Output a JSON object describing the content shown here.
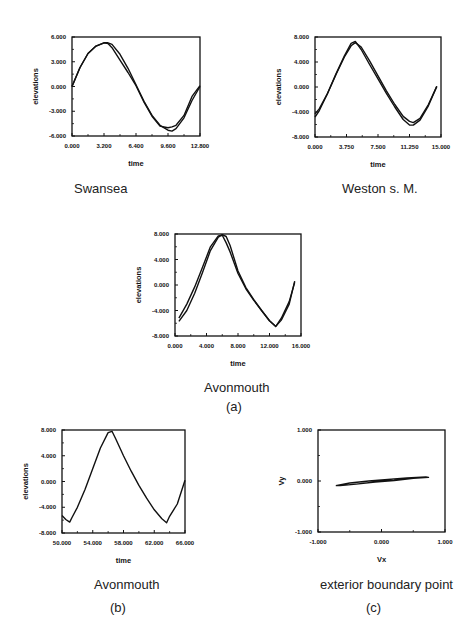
{
  "figure": {
    "part_labels": {
      "a": "(a)",
      "b": "(b)",
      "c": "(c)"
    }
  },
  "chart_data": [
    {
      "id": "swansea",
      "type": "line",
      "caption": "Swansea",
      "xlabel": "time",
      "ylabel": "elevations",
      "xlim": [
        0,
        12800
      ],
      "ylim": [
        -6000,
        6000
      ],
      "xticks": [
        "0.000",
        "3.200",
        "6.400",
        "9.600",
        "12.800"
      ],
      "yticks": [
        "6.000",
        "3.000",
        "0.000",
        "-3.000",
        "-6.000"
      ],
      "grid": false,
      "series": [
        {
          "name": "computed",
          "x": [
            0,
            800,
            1600,
            2400,
            3200,
            3600,
            4000,
            4800,
            5600,
            6400,
            7200,
            8000,
            8800,
            9600,
            10000,
            10400,
            11200,
            12000,
            12800
          ],
          "y": [
            0,
            2300,
            4000,
            4900,
            5300,
            5300,
            5100,
            3900,
            2200,
            200,
            -1800,
            -3500,
            -4700,
            -5300,
            -5400,
            -5100,
            -3800,
            -1700,
            0
          ]
        },
        {
          "name": "observed",
          "x": [
            0,
            800,
            1600,
            2400,
            3200,
            3600,
            4000,
            4800,
            5600,
            6400,
            7200,
            8000,
            8800,
            9600,
            10000,
            10400,
            11200,
            12000,
            12800
          ],
          "y": [
            0,
            2300,
            4000,
            4900,
            5300,
            5200,
            4700,
            3200,
            1700,
            100,
            -1900,
            -3600,
            -4800,
            -5000,
            -4900,
            -4700,
            -3500,
            -1200,
            100
          ]
        }
      ]
    },
    {
      "id": "weston",
      "type": "line",
      "caption": "Weston s. M.",
      "xlabel": "time",
      "ylabel": "elevations",
      "xlim": [
        0,
        15000
      ],
      "ylim": [
        -8000,
        8000
      ],
      "xticks": [
        "0.000",
        "3.750",
        "7.500",
        "11.250",
        "15.000"
      ],
      "yticks": [
        "8.000",
        "4.000",
        "0.000",
        "-4.000",
        "-8.000"
      ],
      "grid": false,
      "series": [
        {
          "name": "computed",
          "x": [
            0,
            500,
            1500,
            2500,
            3500,
            4300,
            4800,
            5500,
            6500,
            7500,
            8500,
            9500,
            10500,
            11250,
            11700,
            12500,
            13500,
            14500
          ],
          "y": [
            -4800,
            -3800,
            -1000,
            2000,
            4800,
            6600,
            7100,
            6400,
            4200,
            1800,
            -600,
            -2800,
            -4700,
            -5500,
            -5700,
            -5000,
            -2800,
            100
          ]
        },
        {
          "name": "observed",
          "x": [
            0,
            500,
            1500,
            2500,
            3500,
            4300,
            4800,
            5500,
            6500,
            7500,
            8500,
            9500,
            10500,
            11250,
            11700,
            12500,
            13500,
            14500
          ],
          "y": [
            -4300,
            -3500,
            -1000,
            2100,
            5000,
            7000,
            7300,
            6000,
            3600,
            1300,
            -1000,
            -3200,
            -5200,
            -6100,
            -6100,
            -5300,
            -3000,
            100
          ]
        }
      ]
    },
    {
      "id": "avonmouth_a",
      "type": "line",
      "caption": "Avonmouth",
      "xlabel": "time",
      "ylabel": "elevations",
      "xlim": [
        0,
        16000
      ],
      "ylim": [
        -8000,
        8000
      ],
      "xticks": [
        "0.000",
        "4.000",
        "8.000",
        "12.000",
        "16.000"
      ],
      "yticks": [
        "8.000",
        "4.000",
        "0.000",
        "-4.000",
        "-8.000"
      ],
      "grid": false,
      "series": [
        {
          "name": "computed",
          "x": [
            500,
            1500,
            2500,
            3500,
            4500,
            5500,
            6000,
            6500,
            7000,
            8000,
            9000,
            10000,
            11000,
            12000,
            12800,
            13500,
            14500,
            15200
          ],
          "y": [
            -5200,
            -3000,
            -300,
            2800,
            6000,
            7700,
            7800,
            6600,
            5200,
            1800,
            -600,
            -2400,
            -4000,
            -5600,
            -6500,
            -5200,
            -2600,
            400
          ]
        },
        {
          "name": "observed",
          "x": [
            500,
            1500,
            2500,
            3500,
            4500,
            5500,
            6000,
            6500,
            7000,
            8000,
            9000,
            10000,
            11000,
            12000,
            12800,
            13500,
            14500,
            15200
          ],
          "y": [
            -5700,
            -4000,
            -1300,
            2000,
            5400,
            7500,
            7900,
            7600,
            6200,
            2200,
            -400,
            -2300,
            -4000,
            -5600,
            -6500,
            -5500,
            -3000,
            600
          ]
        }
      ]
    },
    {
      "id": "avonmouth_b",
      "type": "line",
      "caption": "Avonmouth",
      "xlabel": "time",
      "ylabel": "elevations",
      "xlim": [
        50000,
        66000
      ],
      "ylim": [
        -8000,
        8000
      ],
      "xticks": [
        "50.000",
        "54.000",
        "58.000",
        "62.000",
        "66.000"
      ],
      "yticks": [
        "8.000",
        "4.000",
        "0.000",
        "-4.000",
        "-8.000"
      ],
      "grid": false,
      "series": [
        {
          "name": "long-run",
          "x": [
            50000,
            50500,
            51000,
            51300,
            52000,
            53000,
            54000,
            55000,
            56000,
            56500,
            57000,
            58000,
            59000,
            60000,
            61000,
            62000,
            63000,
            63600,
            64000,
            65000,
            66000
          ],
          "y": [
            -5300,
            -5900,
            -6300,
            -5600,
            -4000,
            -1200,
            2000,
            5200,
            7600,
            7800,
            6600,
            4000,
            1600,
            -600,
            -2600,
            -4400,
            -5800,
            -6400,
            -5400,
            -3500,
            200
          ]
        }
      ]
    },
    {
      "id": "exterior_boundary_point",
      "type": "line",
      "caption": "exterior boundary point",
      "xlabel": "Vx",
      "ylabel": "Vy",
      "xlim": [
        -1,
        1
      ],
      "ylim": [
        -1,
        1
      ],
      "xticks": [
        "-1.000",
        "0.000",
        "1.000"
      ],
      "yticks": [
        "1.000",
        "0.000",
        "-1.000"
      ],
      "grid": false,
      "series": [
        {
          "name": "velocity hodograph",
          "x": [
            -0.72,
            -0.5,
            -0.2,
            0.1,
            0.4,
            0.7,
            0.74,
            0.5,
            0.2,
            -0.1,
            -0.4,
            -0.65,
            -0.72
          ],
          "y": [
            -0.09,
            -0.04,
            0.0,
            0.03,
            0.06,
            0.08,
            0.07,
            0.05,
            0.01,
            -0.02,
            -0.06,
            -0.09,
            -0.09
          ]
        }
      ]
    }
  ]
}
